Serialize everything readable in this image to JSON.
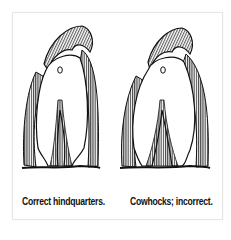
{
  "figure": {
    "panels": [
      {
        "id": "correct",
        "caption": "Correct hindquarters.",
        "depicts": "rear view of dog hindquarters, legs parallel"
      },
      {
        "id": "incorrect",
        "caption": "Cowhocks; incorrect.",
        "depicts": "rear view of dog hindquarters, hocks turned inward"
      }
    ]
  },
  "colors": {
    "ink": "#111111",
    "background": "#ffffff",
    "border": "#e6e6e6"
  }
}
